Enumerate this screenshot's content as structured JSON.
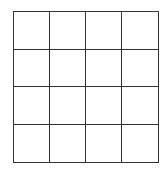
{
  "grid": {
    "rows": 4,
    "cols": 4,
    "line_color": "#333333",
    "cell_color": "#ffffff",
    "cells": [
      [
        "",
        "",
        "",
        ""
      ],
      [
        "",
        "",
        "",
        ""
      ],
      [
        "",
        "",
        "",
        ""
      ],
      [
        "",
        "",
        "",
        ""
      ]
    ]
  }
}
